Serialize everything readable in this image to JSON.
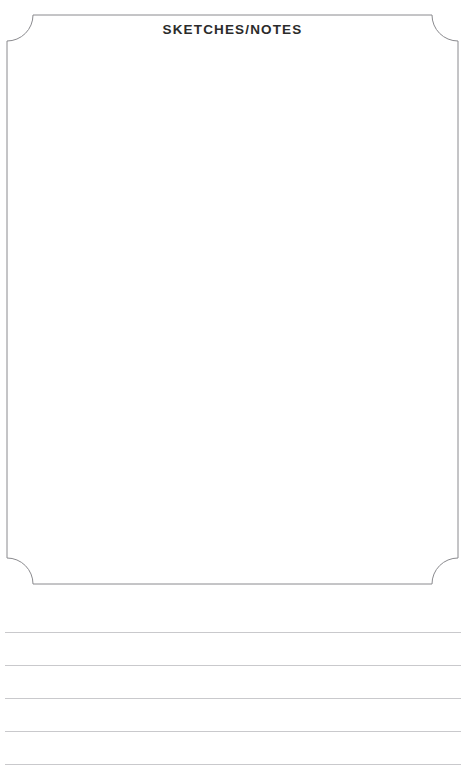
{
  "page": {
    "background_color": "#ffffff",
    "width": 465,
    "height": 782
  },
  "sketch_panel": {
    "title": "SKETCHES/NOTES",
    "title_color": "#2b2b2b",
    "border_color": "#8a8a8e",
    "border_width": 1,
    "corner_style": "concave-arc",
    "corner_radius": 26,
    "frame": {
      "left": 7,
      "top": 15,
      "right": 458,
      "bottom": 584
    },
    "content": {
      "value": "",
      "placeholder": ""
    }
  },
  "ruled_area": {
    "line_color": "#c9c9cc",
    "line_count": 6,
    "line_spacing": 33,
    "lines": [
      {
        "index": 1,
        "y": 615,
        "value": ""
      },
      {
        "index": 2,
        "y": 648,
        "value": ""
      },
      {
        "index": 3,
        "y": 681,
        "value": ""
      },
      {
        "index": 4,
        "y": 714,
        "value": ""
      },
      {
        "index": 5,
        "y": 747,
        "value": ""
      },
      {
        "index": 6,
        "y": 780,
        "value": ""
      }
    ]
  }
}
